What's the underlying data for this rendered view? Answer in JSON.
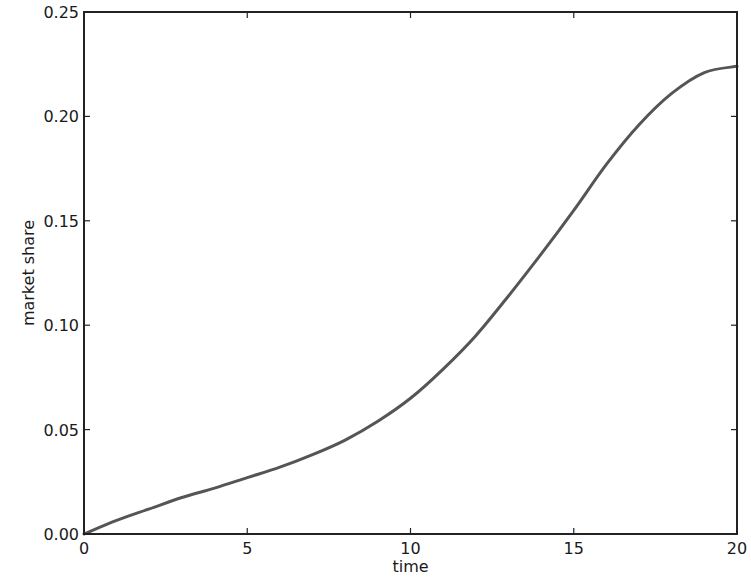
{
  "chart_data": {
    "type": "line",
    "title": "",
    "xlabel": "time",
    "ylabel": "market share",
    "xlim": [
      0,
      20
    ],
    "ylim": [
      0.0,
      0.25
    ],
    "grid": false,
    "legend": null,
    "xticks": [
      0,
      5,
      10,
      15,
      20
    ],
    "xtick_labels": [
      "0",
      "5",
      "10",
      "15",
      "20"
    ],
    "yticks": [
      0.0,
      0.05,
      0.1,
      0.15,
      0.2,
      0.25
    ],
    "ytick_labels": [
      "0.00",
      "0.05",
      "0.10",
      "0.15",
      "0.20",
      "0.25"
    ],
    "series": [
      {
        "name": "market share",
        "color": "#555555",
        "x": [
          0,
          1,
          2,
          3,
          4,
          5,
          6,
          7,
          8,
          9,
          10,
          11,
          12,
          13,
          14,
          15,
          16,
          17,
          18,
          19,
          20
        ],
        "values": [
          0.0,
          0.0065,
          0.012,
          0.0175,
          0.022,
          0.027,
          0.032,
          0.038,
          0.045,
          0.054,
          0.065,
          0.079,
          0.095,
          0.114,
          0.134,
          0.155,
          0.177,
          0.196,
          0.211,
          0.221,
          0.224
        ]
      }
    ]
  }
}
